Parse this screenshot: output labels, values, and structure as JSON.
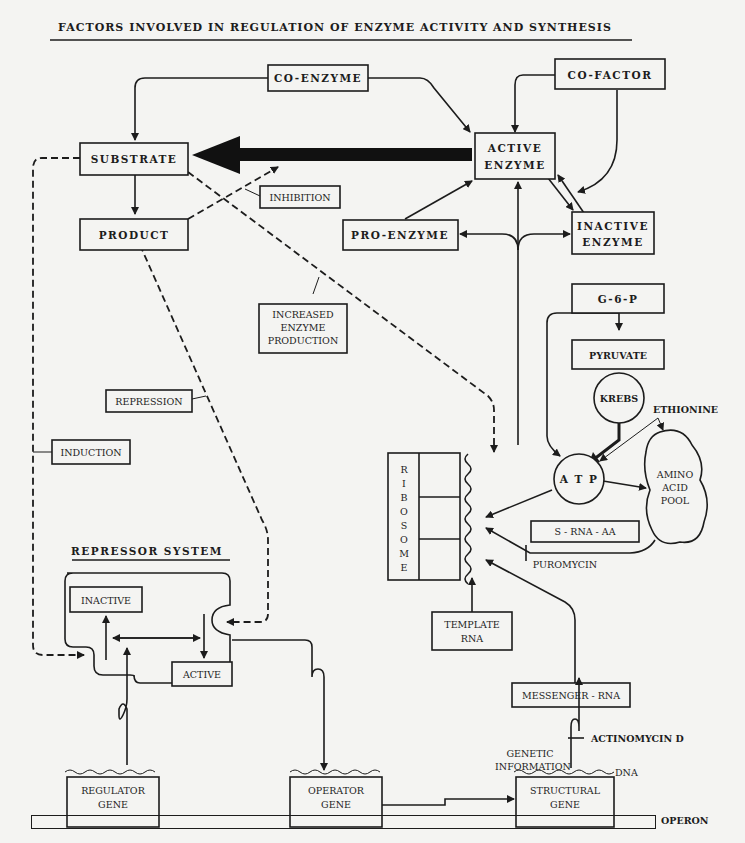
{
  "title": "FACTORS INVOLVED IN REGULATION OF ENZYME ACTIVITY AND SYNTHESIS",
  "nodes": {
    "co_enzyme": "CO-ENZYME",
    "co_factor": "CO-FACTOR",
    "substrate": "SUBSTRATE",
    "active_enzyme_1": "ACTIVE",
    "active_enzyme_2": "ENZYME",
    "inhibition": "INHIBITION",
    "product": "PRODUCT",
    "pro_enzyme": "PRO-ENZYME",
    "inactive_enzyme_1": "INACTIVE",
    "inactive_enzyme_2": "ENZYME",
    "increased_1": "INCREASED",
    "increased_2": "ENZYME",
    "increased_3": "PRODUCTION",
    "g6p": "G-6-P",
    "pyruvate": "PYRUVATE",
    "krebs": "KREBS",
    "ethionine": "ETHIONINE",
    "repression": "REPRESSION",
    "induction": "INDUCTION",
    "atp": "A T P",
    "amino_1": "AMINO",
    "amino_2": "ACID",
    "amino_3": "POOL",
    "ribosome_letters": [
      "R",
      "I",
      "B",
      "O",
      "S",
      "O",
      "M",
      "E"
    ],
    "s_rna_aa": "S - RNA - AA",
    "puromycin": "PUROMYCIN",
    "repressor_system": "REPRESSOR SYSTEM",
    "rep_inactive": "INACTIVE",
    "rep_active": "ACTIVE",
    "template_1": "TEMPLATE",
    "template_2": "RNA",
    "messenger_rna": "MESSENGER - RNA",
    "actinomycin": "ACTINOMYCIN  D",
    "genetic_1": "GENETIC",
    "genetic_2": "INFORMATION",
    "dna": "DNA",
    "regulator_1": "REGULATOR",
    "regulator_2": "GENE",
    "operator_1": "OPERATOR",
    "operator_2": "GENE",
    "structural_1": "STRUCTURAL",
    "structural_2": "GENE",
    "operon": "OPERON"
  }
}
